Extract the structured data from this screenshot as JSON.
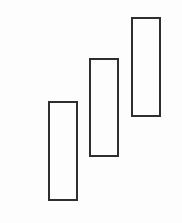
{
  "diagram": {
    "type": "candlestick-pattern",
    "background": "#ffffff",
    "stroke_color": "#2e2e2e",
    "stroke_width": 2,
    "candles": [
      {
        "label": "",
        "style": "hollow",
        "left": 48,
        "top": 101,
        "width": 30,
        "height": 100
      },
      {
        "label": "",
        "style": "hollow",
        "left": 89,
        "top": 58,
        "width": 30,
        "height": 99
      },
      {
        "label": "",
        "style": "hollow",
        "left": 131,
        "top": 17,
        "width": 30,
        "height": 100
      }
    ]
  }
}
